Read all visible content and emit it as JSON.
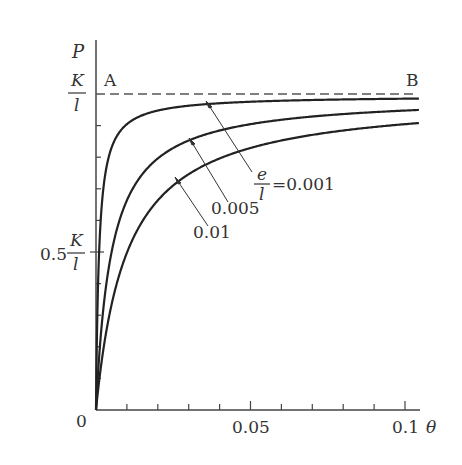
{
  "chart_data": {
    "type": "line",
    "title": "",
    "xlabel": "θ",
    "ylabel": "P",
    "xlim": [
      0,
      0.105
    ],
    "ylim": [
      0,
      1.0
    ],
    "y_unit": "K/l",
    "x_ticks": [
      0,
      0.01,
      0.02,
      0.03,
      0.04,
      0.05,
      0.06,
      0.07,
      0.08,
      0.09,
      0.1
    ],
    "x_tick_labels": [
      "0",
      "0.05",
      "0.1"
    ],
    "y_tick_labels": [
      "0.5 K/l",
      "K/l"
    ],
    "asymptote": {
      "label_start": "A",
      "label_end": "B",
      "value": 1.0,
      "style": "dashed"
    },
    "series": [
      {
        "name": "e/l = 0.001",
        "e_over_l": 0.001,
        "x": [
          0,
          0.001,
          0.002,
          0.005,
          0.01,
          0.02,
          0.05,
          0.1
        ],
        "values": [
          0,
          0.5,
          0.67,
          0.83,
          0.91,
          0.95,
          0.98,
          0.99
        ]
      },
      {
        "name": "0.005",
        "e_over_l": 0.005,
        "x": [
          0,
          0.005,
          0.01,
          0.02,
          0.03,
          0.05,
          0.075,
          0.1
        ],
        "values": [
          0,
          0.5,
          0.67,
          0.8,
          0.86,
          0.91,
          0.94,
          0.95
        ]
      },
      {
        "name": "0.01",
        "e_over_l": 0.01,
        "x": [
          0,
          0.01,
          0.02,
          0.03,
          0.04,
          0.05,
          0.075,
          0.1
        ],
        "values": [
          0,
          0.5,
          0.67,
          0.75,
          0.8,
          0.83,
          0.88,
          0.91
        ]
      }
    ],
    "annotations": [
      "e/l = 0.001",
      "0.005",
      "0.01"
    ],
    "grid": false,
    "legend": "none (curve labels with arrows)"
  },
  "labels": {
    "y_axis": "P",
    "x_axis": "θ",
    "origin": "0",
    "x_mid": "0.05",
    "x_end": "0.1",
    "y_half_prefix": "0.5",
    "frac_num": "K",
    "frac_den": "l",
    "point_a": "A",
    "point_b": "B",
    "curve1_num": "e",
    "curve1_den": "l",
    "curve1_val": "=0.001",
    "curve2": "0.005",
    "curve3": "0.01"
  },
  "colors": {
    "ink": "#333333",
    "dash": "#555555"
  }
}
